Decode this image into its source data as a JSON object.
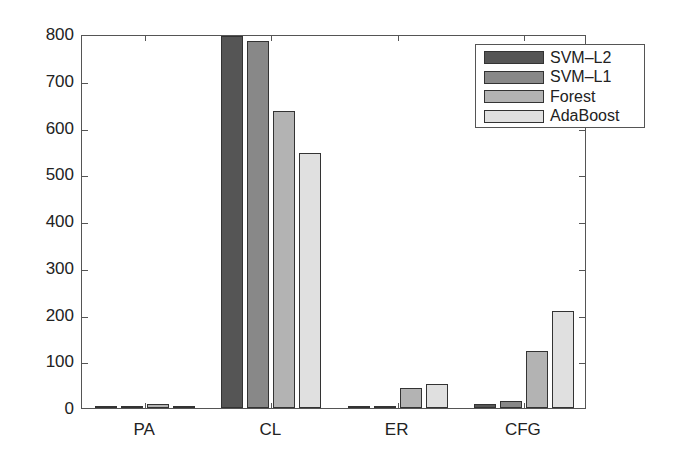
{
  "chart_data": {
    "type": "bar",
    "title": "",
    "xlabel": "",
    "ylabel": "",
    "categories": [
      "PA",
      "CL",
      "ER",
      "CFG"
    ],
    "series": [
      {
        "name": "SVM–L2",
        "color": "#555555",
        "values": [
          2,
          795,
          3,
          8
        ]
      },
      {
        "name": "SVM–L1",
        "color": "#888888",
        "values": [
          4,
          785,
          3,
          15
        ]
      },
      {
        "name": "Forest",
        "color": "#b3b3b3",
        "values": [
          8,
          635,
          43,
          123
        ]
      },
      {
        "name": "AdaBoost",
        "color": "#e0e0e0",
        "values": [
          4,
          545,
          52,
          207
        ]
      }
    ],
    "ylim": [
      0,
      800
    ],
    "yticks": [
      0,
      100,
      200,
      300,
      400,
      500,
      600,
      700,
      800
    ],
    "grid": false,
    "legend_position": "upper right"
  }
}
